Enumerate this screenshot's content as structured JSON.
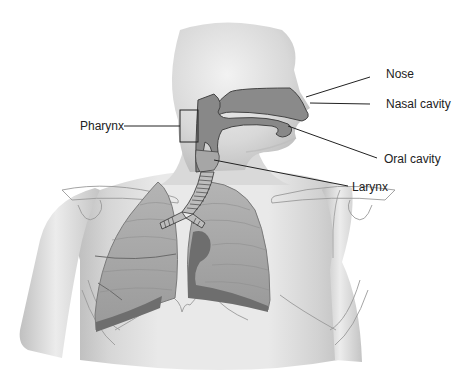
{
  "diagram": {
    "labels": {
      "nose": "Nose",
      "nasal_cavity": "Nasal cavity",
      "oral_cavity": "Oral cavity",
      "larynx": "Larynx",
      "pharynx": "Pharynx"
    },
    "colors": {
      "skin_light": "#e6e6e6",
      "skin_mid": "#c8c8c8",
      "airway": "#8a8a8a",
      "lung": "#a6a6a6",
      "lung_dark": "#6e6e6e",
      "outline": "#555555",
      "leader_line": "#222222"
    }
  }
}
